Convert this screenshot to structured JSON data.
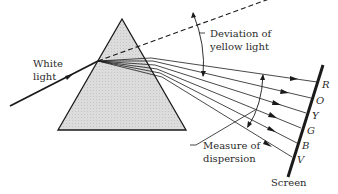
{
  "figure": {
    "type": "prism dispersion diagram",
    "labels": {
      "white_light_line1": "White",
      "white_light_line2": "light",
      "deviation_line1": "Deviation of",
      "deviation_line2": "yellow light",
      "dispersion_line1": "Measure of",
      "dispersion_line2": "dispersion",
      "screen": "Screen"
    },
    "spectrum_colors": [
      "R",
      "O",
      "Y",
      "G",
      "B",
      "V"
    ],
    "colors": {
      "ink": "#1a1a1a",
      "prism_fill": "#d6d6d6",
      "background": "#ffffff"
    }
  }
}
